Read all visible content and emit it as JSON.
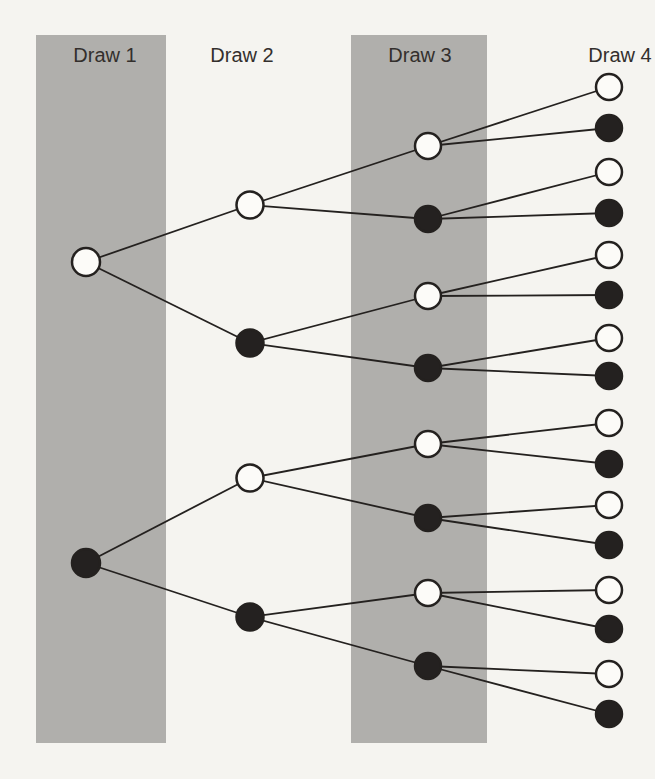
{
  "figure": {
    "type": "probability-tree-diagram",
    "canvas": {
      "width": 655,
      "height": 779
    },
    "colors": {
      "background": "#f5f4f0",
      "band": "#b0afac",
      "edge": "#24211f",
      "node_stroke": "#24211f",
      "white_node_fill": "#fcfbf8",
      "black_node_fill": "#242120",
      "label_text": "#332f2d"
    },
    "style": {
      "label_font_size": 20,
      "label_baseline_y": 62,
      "edge_width": 1.8,
      "node_stroke_width": 2.5
    },
    "columns": [
      {
        "id": "draw1",
        "label": "Draw 1",
        "label_x": 105,
        "node_x": 86,
        "node_radius": 14,
        "band": {
          "x": 36,
          "y": 35,
          "width": 130,
          "height": 708
        },
        "nodes": [
          {
            "id": "c0-0",
            "y": 262,
            "color": "white"
          },
          {
            "id": "c0-1",
            "y": 563,
            "color": "black"
          }
        ]
      },
      {
        "id": "draw2",
        "label": "Draw 2",
        "label_x": 242,
        "node_x": 250,
        "node_radius": 13.5,
        "band": null,
        "nodes": [
          {
            "id": "c1-0",
            "y": 205,
            "color": "white"
          },
          {
            "id": "c1-1",
            "y": 343,
            "color": "black"
          },
          {
            "id": "c1-2",
            "y": 478,
            "color": "white"
          },
          {
            "id": "c1-3",
            "y": 617,
            "color": "black"
          }
        ]
      },
      {
        "id": "draw3",
        "label": "Draw 3",
        "label_x": 420,
        "node_x": 428,
        "node_radius": 13,
        "band": {
          "x": 351,
          "y": 35,
          "width": 136,
          "height": 708
        },
        "nodes": [
          {
            "id": "c2-0",
            "y": 146,
            "color": "white"
          },
          {
            "id": "c2-1",
            "y": 219,
            "color": "black"
          },
          {
            "id": "c2-2",
            "y": 296,
            "color": "white"
          },
          {
            "id": "c2-3",
            "y": 368,
            "color": "black"
          },
          {
            "id": "c2-4",
            "y": 444,
            "color": "white"
          },
          {
            "id": "c2-5",
            "y": 518,
            "color": "black"
          },
          {
            "id": "c2-6",
            "y": 593,
            "color": "white"
          },
          {
            "id": "c2-7",
            "y": 666,
            "color": "black"
          }
        ]
      },
      {
        "id": "draw4",
        "label": "Draw 4",
        "label_x": 620,
        "node_x": 609,
        "node_radius": 13,
        "band": null,
        "nodes": [
          {
            "id": "c3-0",
            "y": 87,
            "color": "white"
          },
          {
            "id": "c3-1",
            "y": 128,
            "color": "black"
          },
          {
            "id": "c3-2",
            "y": 172,
            "color": "white"
          },
          {
            "id": "c3-3",
            "y": 213,
            "color": "black"
          },
          {
            "id": "c3-4",
            "y": 255,
            "color": "white"
          },
          {
            "id": "c3-5",
            "y": 295,
            "color": "black"
          },
          {
            "id": "c3-6",
            "y": 338,
            "color": "white"
          },
          {
            "id": "c3-7",
            "y": 376,
            "color": "black"
          },
          {
            "id": "c3-8",
            "y": 423,
            "color": "white"
          },
          {
            "id": "c3-9",
            "y": 464,
            "color": "black"
          },
          {
            "id": "c3-10",
            "y": 505,
            "color": "white"
          },
          {
            "id": "c3-11",
            "y": 545,
            "color": "black"
          },
          {
            "id": "c3-12",
            "y": 590,
            "color": "white"
          },
          {
            "id": "c3-13",
            "y": 629,
            "color": "black"
          },
          {
            "id": "c3-14",
            "y": 674,
            "color": "white"
          },
          {
            "id": "c3-15",
            "y": 714,
            "color": "black"
          }
        ]
      }
    ],
    "edges": [
      [
        "c0-0",
        "c1-0"
      ],
      [
        "c0-0",
        "c1-1"
      ],
      [
        "c0-1",
        "c1-2"
      ],
      [
        "c0-1",
        "c1-3"
      ],
      [
        "c1-0",
        "c2-0"
      ],
      [
        "c1-0",
        "c2-1"
      ],
      [
        "c1-1",
        "c2-2"
      ],
      [
        "c1-1",
        "c2-3"
      ],
      [
        "c1-2",
        "c2-4"
      ],
      [
        "c1-2",
        "c2-5"
      ],
      [
        "c1-3",
        "c2-6"
      ],
      [
        "c1-3",
        "c2-7"
      ],
      [
        "c2-0",
        "c3-0"
      ],
      [
        "c2-0",
        "c3-1"
      ],
      [
        "c2-1",
        "c3-2"
      ],
      [
        "c2-1",
        "c3-3"
      ],
      [
        "c2-2",
        "c3-4"
      ],
      [
        "c2-2",
        "c3-5"
      ],
      [
        "c2-3",
        "c3-6"
      ],
      [
        "c2-3",
        "c3-7"
      ],
      [
        "c2-4",
        "c3-8"
      ],
      [
        "c2-4",
        "c3-9"
      ],
      [
        "c2-5",
        "c3-10"
      ],
      [
        "c2-5",
        "c3-11"
      ],
      [
        "c2-6",
        "c3-12"
      ],
      [
        "c2-6",
        "c3-13"
      ],
      [
        "c2-7",
        "c3-14"
      ],
      [
        "c2-7",
        "c3-15"
      ]
    ]
  }
}
